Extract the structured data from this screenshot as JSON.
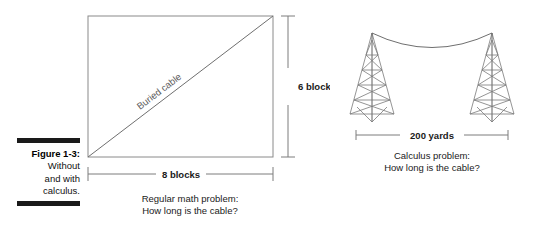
{
  "figure": {
    "caption_number": "Figure 1-3:",
    "caption_lines": [
      "Without",
      "and with",
      "calculus."
    ]
  },
  "left_diagram": {
    "name": "rectangle-buried-cable",
    "diagonal_label": "Buried cable",
    "width_dimension": "8 blocks",
    "height_dimension": "6 blocks",
    "caption_line_1": "Regular math problem:",
    "caption_line_2": "How long is the cable?"
  },
  "right_diagram": {
    "name": "towers-hanging-cable",
    "span_dimension": "200 yards",
    "caption_line_1": "Calculus problem:",
    "caption_line_2": "How long is the cable?"
  },
  "colors": {
    "background": "#ffffff",
    "rule": "#1a1a1a",
    "line": "#8a8a8a",
    "text": "#1a1a1a",
    "diagonal_label": "#5a5a5a"
  }
}
